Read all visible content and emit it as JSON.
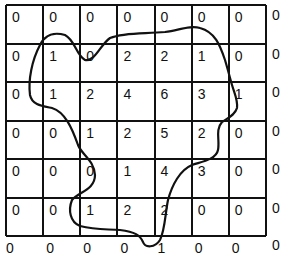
{
  "diagram": {
    "type": "grid-with-contour",
    "columns": 7,
    "rows": 6,
    "cell_values": [
      [
        "0",
        "0",
        "0",
        "0",
        "0",
        "0",
        "0"
      ],
      [
        "0",
        "1",
        "0",
        "2",
        "2",
        "1",
        "0"
      ],
      [
        "0",
        "1",
        "2",
        "4",
        "6",
        "3",
        "1"
      ],
      [
        "0",
        "0",
        "1",
        "2",
        "5",
        "2",
        "0"
      ],
      [
        "0",
        "0",
        "0",
        "1",
        "4",
        "3",
        "0"
      ],
      [
        "0",
        "0",
        "1",
        "2",
        "2",
        "0",
        "0"
      ]
    ],
    "right_edge_values": [
      "0",
      "0",
      "0",
      "0",
      "0",
      "0"
    ],
    "bottom_edge_values": [
      "0",
      "0",
      "0",
      "0",
      "1",
      "0",
      "0",
      "0"
    ],
    "line_color": "#111111",
    "background_color": "#ffffff"
  }
}
